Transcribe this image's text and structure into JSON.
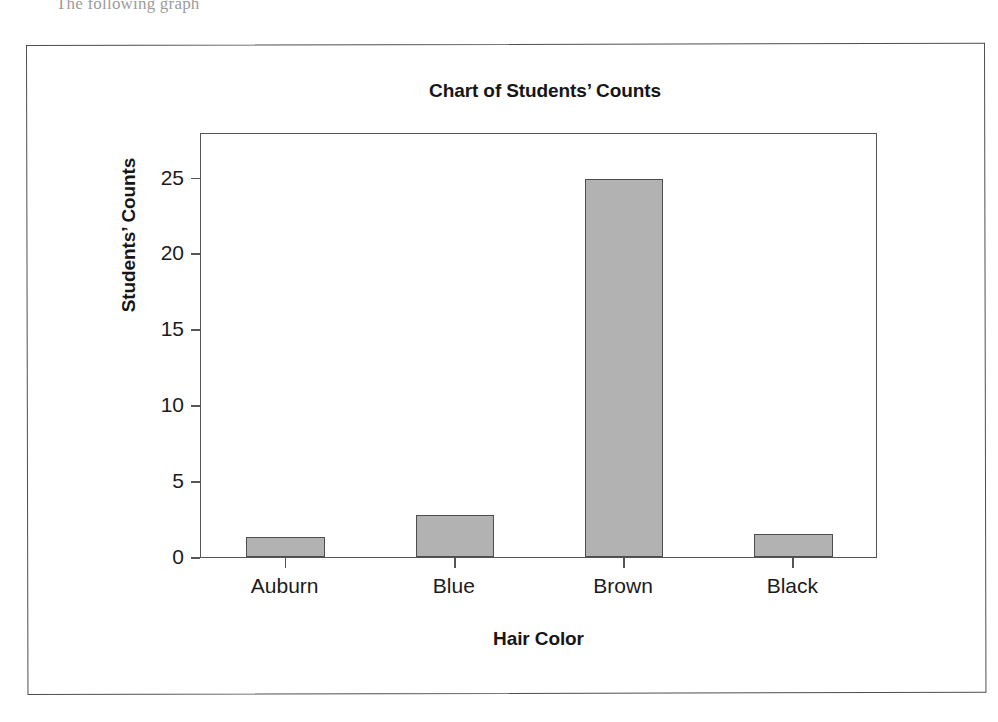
{
  "page": {
    "ghost_text": "The following graph",
    "background_color": "#ffffff",
    "border_color": "#4e4e4e"
  },
  "chart_data": {
    "type": "bar",
    "title": "Chart of Students’ Counts",
    "xlabel": "Hair Color",
    "ylabel": "Students’ Counts",
    "categories": [
      "Auburn",
      "Blue",
      "Brown",
      "Black"
    ],
    "values": [
      1.3,
      2.8,
      24.9,
      1.5
    ],
    "ylim": [
      0,
      28
    ],
    "yticks": [
      0,
      5,
      10,
      15,
      20,
      25
    ],
    "ytick_labels": [
      "0",
      "5",
      "10",
      "15",
      "20",
      "25"
    ],
    "grid": false,
    "legend": "none",
    "bar_fill_color": "#b2b2b2",
    "bar_edge_color": "#4d4d4d",
    "axis_color": "#555555"
  }
}
